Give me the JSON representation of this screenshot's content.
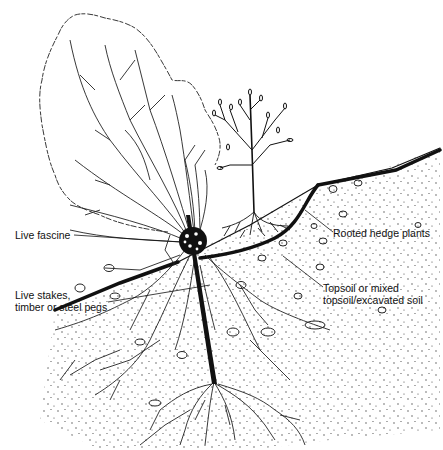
{
  "diagram": {
    "type": "cross-section illustration",
    "colors": {
      "ink": "#111111",
      "background": "#ffffff"
    },
    "labels": [
      {
        "id": "live-fascine",
        "text": "Live fascine",
        "x": 15,
        "y": 228
      },
      {
        "id": "rooted-hedge-plants",
        "text": "Rooted hedge plants",
        "x": 333,
        "y": 232
      },
      {
        "id": "topsoil-line1",
        "text": "Topsoil or mixed",
        "x": 323,
        "y": 286
      },
      {
        "id": "topsoil-line2",
        "text": "topsoil/excavated soil",
        "x": 323,
        "y": 298
      },
      {
        "id": "live-stakes-line1",
        "text": "Live stakes,",
        "x": 15,
        "y": 297
      },
      {
        "id": "live-stakes-line2",
        "text": "timber or steel pegs",
        "x": 15,
        "y": 309
      }
    ],
    "elements": [
      "shrub-canopy-outline",
      "shrub-branches",
      "hedge-plant",
      "hedge-plant-roots",
      "live-fascine-bundle",
      "live-stake",
      "ground-surface",
      "trench-cut",
      "soil-stipple",
      "stones",
      "roots"
    ]
  }
}
